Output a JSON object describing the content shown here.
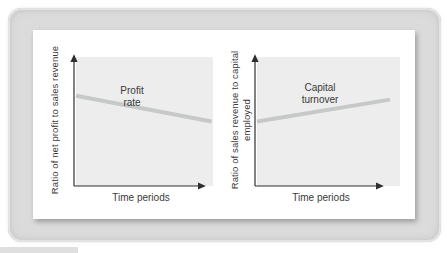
{
  "figure": {
    "text_color": "#3a3a3a",
    "frame_color": "#dbdbdb",
    "panel_color": "#ffffff",
    "plot_bg_color": "#ededed",
    "trend_line_color": "#c7c9c9",
    "axis_color": "#2e2e2e"
  },
  "charts": [
    {
      "ylabel_lines": [
        "Ratio of net profit to sales revenue"
      ],
      "xlabel": "Time periods",
      "series_label_lines": [
        "Profit",
        "rate"
      ]
    },
    {
      "ylabel_lines": [
        "Ratio of sales revenue to capital",
        "employed"
      ],
      "xlabel": "Time periods",
      "series_label_lines": [
        "Capital",
        "turnover"
      ]
    }
  ],
  "chart_data": [
    {
      "type": "line",
      "title": "",
      "xlabel": "Time periods",
      "ylabel": "Ratio of net profit to sales revenue",
      "series": [
        {
          "name": "Profit rate",
          "points": [
            {
              "x": 0.0,
              "y": 0.7
            },
            {
              "x": 0.99,
              "y": 0.5
            }
          ]
        }
      ],
      "x_range": [
        0,
        1
      ],
      "y_range": [
        0,
        1
      ],
      "ticks": "none (qualitative trend sketch)",
      "grid": false,
      "legend": "inline label above line",
      "trend": "declining"
    },
    {
      "type": "line",
      "title": "",
      "xlabel": "Time periods",
      "ylabel": "Ratio of sales revenue to capital employed",
      "series": [
        {
          "name": "Capital turnover",
          "points": [
            {
              "x": 0.0,
              "y": 0.5
            },
            {
              "x": 0.93,
              "y": 0.67
            }
          ]
        }
      ],
      "x_range": [
        0,
        1
      ],
      "y_range": [
        0,
        1
      ],
      "ticks": "none (qualitative trend sketch)",
      "grid": false,
      "legend": "inline label above line",
      "trend": "rising"
    }
  ]
}
